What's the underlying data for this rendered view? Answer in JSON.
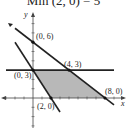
{
  "title": "Min (2, 0) = 5",
  "chart_data": {
    "type": "line",
    "title": "Min (2, 0) = 5",
    "xlabel": "x",
    "ylabel": "y",
    "xlim": [
      -3,
      9
    ],
    "ylim": [
      -4,
      8
    ],
    "grid": false,
    "feasible_region": {
      "vertices": [
        [
          0,
          3
        ],
        [
          4,
          3
        ],
        [
          8,
          0
        ],
        [
          2,
          0
        ]
      ],
      "fill": "#b8b8b8"
    },
    "lines": [
      {
        "name": "line through (0,6) and (8,0)",
        "points": [
          [
            -2,
            7.5
          ],
          [
            9,
            -0.75
          ]
        ]
      },
      {
        "name": "horizontal line y = 3",
        "points": [
          [
            -3,
            3
          ],
          [
            9,
            3
          ]
        ]
      },
      {
        "name": "line through (0,3) and (2,0)",
        "points": [
          [
            -2,
            6
          ],
          [
            3,
            -1.5
          ]
        ]
      }
    ],
    "points": [
      {
        "label": "(0, 6)",
        "x": 0,
        "y": 6
      },
      {
        "label": "(0, 3)",
        "x": 0,
        "y": 3
      },
      {
        "label": "(4, 3)",
        "x": 4,
        "y": 3
      },
      {
        "label": "(8, 0)",
        "x": 8,
        "y": 0
      },
      {
        "label": "(2, 0)",
        "x": 2,
        "y": 0
      }
    ],
    "colors": {
      "line": "#222222",
      "region": "#b8b8b8"
    }
  }
}
